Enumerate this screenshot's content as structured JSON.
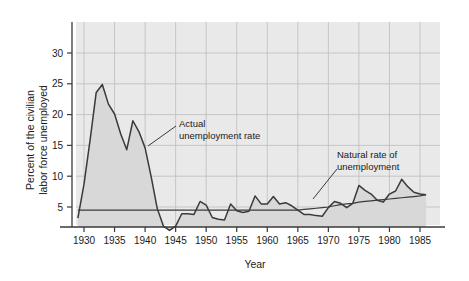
{
  "figure": {
    "background": "#ffffff",
    "plot_background": "#e9e9e9",
    "grid_color": "#bdbdbd",
    "axis_color": "#3a3a3a",
    "series_color": "#3a3a3a",
    "fill_color": "#d8d8d8"
  },
  "axes": {
    "y_title_line1": "Percent of the civilian",
    "y_title_line2": "labor force unemployed",
    "x_title": "Year",
    "y_ticks": [
      "5",
      "10",
      "15",
      "20",
      "25",
      "30"
    ],
    "x_ticks": [
      "1930",
      "1935",
      "1940",
      "1945",
      "1950",
      "1955",
      "1960",
      "1965",
      "1970",
      "1975",
      "1980",
      "1985"
    ]
  },
  "annotations": {
    "actual_line1": "Actual",
    "actual_line2": "unemployment rate",
    "natural_line1": "Natural rate of",
    "natural_line2": "unemployment"
  },
  "chart_data": {
    "type": "line",
    "title": "",
    "xlabel": "Year",
    "ylabel": "Percent of the civilian labor force unemployed",
    "xlim": [
      1929,
      1986
    ],
    "ylim": [
      0,
      33
    ],
    "ytick_values": [
      5,
      10,
      15,
      20,
      25,
      30
    ],
    "xtick_values": [
      1930,
      1935,
      1940,
      1945,
      1950,
      1955,
      1960,
      1965,
      1970,
      1975,
      1980,
      1985
    ],
    "grid": true,
    "legend": "none",
    "x": [
      1929,
      1930,
      1931,
      1932,
      1933,
      1934,
      1935,
      1936,
      1937,
      1938,
      1939,
      1940,
      1941,
      1942,
      1943,
      1944,
      1945,
      1946,
      1947,
      1948,
      1949,
      1950,
      1951,
      1952,
      1953,
      1954,
      1955,
      1956,
      1957,
      1958,
      1959,
      1960,
      1961,
      1962,
      1963,
      1964,
      1965,
      1966,
      1967,
      1968,
      1969,
      1970,
      1971,
      1972,
      1973,
      1974,
      1975,
      1976,
      1977,
      1978,
      1979,
      1980,
      1981,
      1982,
      1983,
      1984,
      1985,
      1986
    ],
    "series": [
      {
        "name": "Actual unemployment rate",
        "filled": true,
        "values": [
          3.2,
          8.7,
          15.9,
          23.6,
          24.9,
          21.7,
          20.1,
          16.9,
          14.3,
          19.0,
          17.2,
          14.6,
          9.9,
          4.7,
          1.9,
          1.2,
          1.9,
          3.9,
          3.9,
          3.8,
          5.9,
          5.3,
          3.3,
          3.0,
          2.9,
          5.5,
          4.4,
          4.1,
          4.3,
          6.8,
          5.5,
          5.5,
          6.7,
          5.5,
          5.7,
          5.2,
          4.5,
          3.8,
          3.8,
          3.6,
          3.5,
          4.9,
          5.9,
          5.6,
          4.9,
          5.6,
          8.5,
          7.7,
          7.1,
          6.1,
          5.8,
          7.1,
          7.6,
          9.5,
          8.3,
          7.4,
          7.1,
          7.0
        ]
      },
      {
        "name": "Natural rate of unemployment",
        "filled": false,
        "values": [
          4.5,
          4.5,
          4.5,
          4.5,
          4.5,
          4.5,
          4.5,
          4.5,
          4.5,
          4.5,
          4.5,
          4.5,
          4.5,
          4.5,
          4.5,
          4.5,
          4.5,
          4.5,
          4.5,
          4.5,
          4.5,
          4.5,
          4.5,
          4.5,
          4.5,
          4.5,
          4.5,
          4.5,
          4.5,
          4.5,
          4.5,
          4.5,
          4.5,
          4.5,
          4.5,
          4.5,
          4.5,
          4.6,
          4.7,
          4.8,
          4.9,
          5.0,
          5.2,
          5.4,
          5.5,
          5.6,
          5.8,
          5.9,
          6.0,
          6.1,
          6.2,
          6.3,
          6.4,
          6.5,
          6.6,
          6.7,
          6.8,
          7.0
        ]
      }
    ]
  }
}
